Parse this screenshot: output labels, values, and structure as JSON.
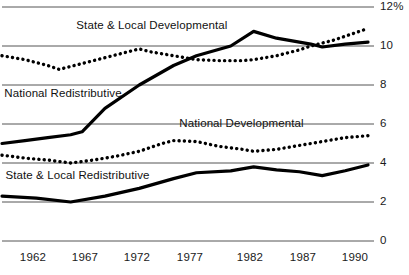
{
  "chart_data": {
    "type": "line",
    "title": "",
    "xlabel": "",
    "ylabel": "",
    "ylim": [
      0,
      12
    ],
    "xlim": [
      1960,
      1992
    ],
    "grid": true,
    "legend_position": "inline-labels",
    "y_ticks": [
      "0",
      "2",
      "4",
      "6",
      "8",
      "10",
      "12%"
    ],
    "y_tick_values": [
      0,
      2,
      4,
      6,
      8,
      10,
      12
    ],
    "x_ticks": [
      "1962",
      "1967",
      "1972",
      "1977",
      "1982",
      "1987",
      "1990"
    ],
    "x_tick_values": [
      1962,
      1967,
      1972,
      1977,
      1982,
      1987,
      1990
    ],
    "series": [
      {
        "name": "State & Local Developmental",
        "style": "solid",
        "label_x": 1966.5,
        "label_y": 11.05,
        "x": [
          1960,
          1962,
          1964,
          1966,
          1967,
          1969,
          1972,
          1975,
          1977,
          1980,
          1982,
          1984,
          1987,
          1988,
          1990,
          1992
        ],
        "values": [
          5.0,
          5.15,
          5.3,
          5.45,
          5.6,
          6.8,
          8.0,
          9.0,
          9.5,
          10.0,
          10.75,
          10.4,
          10.1,
          9.95,
          10.1,
          10.2
        ]
      },
      {
        "name": "National Redistributive",
        "style": "dotted",
        "label_x": 1960.2,
        "label_y": 7.55,
        "x": [
          1960,
          1962,
          1964,
          1965,
          1967,
          1969,
          1971,
          1972,
          1973,
          1975,
          1977,
          1979,
          1981,
          1982,
          1984,
          1986,
          1987,
          1989,
          1990,
          1992
        ],
        "values": [
          9.5,
          9.3,
          9.0,
          8.8,
          9.1,
          9.4,
          9.7,
          9.85,
          9.7,
          9.5,
          9.3,
          9.25,
          9.25,
          9.3,
          9.5,
          9.8,
          10.0,
          10.3,
          10.5,
          10.9
        ]
      },
      {
        "name": "National Developmental",
        "style": "dotted",
        "label_x": 1975.5,
        "label_y": 6.0,
        "x": [
          1960,
          1962,
          1964,
          1966,
          1968,
          1970,
          1972,
          1974,
          1975,
          1977,
          1979,
          1981,
          1982,
          1984,
          1986,
          1988,
          1990,
          1992
        ],
        "values": [
          4.4,
          4.25,
          4.15,
          4.0,
          4.15,
          4.35,
          4.6,
          5.0,
          5.15,
          5.1,
          4.85,
          4.7,
          4.6,
          4.7,
          4.9,
          5.1,
          5.3,
          5.4
        ]
      },
      {
        "name": "State & Local Redistributive",
        "style": "solid",
        "label_x": 1960.3,
        "label_y": 3.35,
        "x": [
          1960,
          1963,
          1966,
          1969,
          1972,
          1975,
          1977,
          1980,
          1982,
          1984,
          1986,
          1988,
          1990,
          1992
        ],
        "values": [
          2.3,
          2.2,
          2.0,
          2.3,
          2.7,
          3.2,
          3.5,
          3.6,
          3.8,
          3.65,
          3.55,
          3.35,
          3.6,
          3.9
        ]
      }
    ],
    "colors": {
      "line": "#000000",
      "gridline": "#555555",
      "text": "#111111",
      "background": "#ffffff"
    }
  }
}
